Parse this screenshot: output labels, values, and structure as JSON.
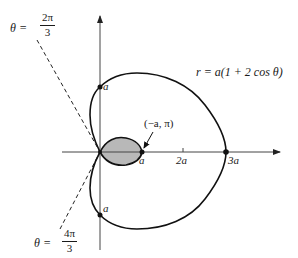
{
  "figure": {
    "equation": "r = a(1 + 2 cos θ)",
    "colors": {
      "curve": "#111111",
      "axis": "#444444",
      "inner_loop_fill": "#b8b8b8",
      "dashed_line": "#222222"
    },
    "axis_labels": {
      "inner_tip": "a",
      "two_a": "2a",
      "three_a": "3a",
      "top_point": "a",
      "bottom_point": "a"
    },
    "annotation": {
      "point_label": "(−a, π)"
    },
    "angle_upper": {
      "theta": "θ =",
      "numerator": "2π",
      "denominator": "3"
    },
    "angle_lower": {
      "theta": "θ =",
      "numerator": "4π",
      "denominator": "3"
    }
  }
}
